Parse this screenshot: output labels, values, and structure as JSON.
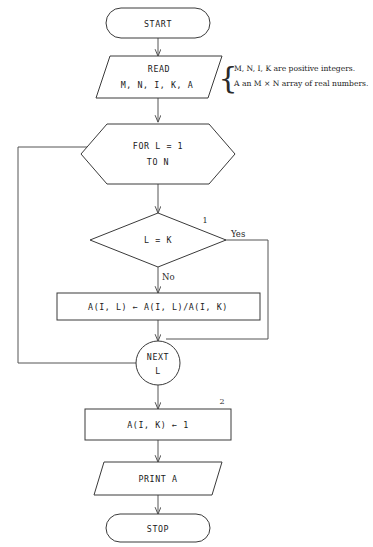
{
  "diagram": {
    "nodes": {
      "start": {
        "label": "START",
        "shape": "terminator"
      },
      "read": {
        "line1": "READ",
        "line2": "M, N, I, K, A",
        "shape": "parallelogram"
      },
      "for_loop": {
        "line1": "FOR L = 1",
        "line2": "TO N",
        "shape": "hexagon"
      },
      "decision": {
        "label": "L = K",
        "shape": "diamond"
      },
      "assign_divide": {
        "label": "A(I, L) ← A(I, L)/A(I, K)",
        "shape": "process"
      },
      "next": {
        "line1": "NEXT",
        "line2": "L",
        "shape": "circle"
      },
      "assign_one": {
        "label": "A(I, K) ← 1",
        "shape": "process"
      },
      "print": {
        "label": "PRINT A",
        "shape": "parallelogram"
      },
      "stop": {
        "label": "STOP",
        "shape": "terminator"
      }
    },
    "edge_labels": {
      "yes": "Yes",
      "no": "No"
    },
    "markers": {
      "one": "1",
      "two": "2"
    },
    "note": {
      "brace": "{",
      "line1": "M, N, I, K are positive integers.",
      "line2": "A an M × N array of real numbers."
    },
    "colors": {
      "shape_stroke": "#3a3a3a",
      "connector_stroke": "#555555",
      "text": "#1a1a1a",
      "background": "#ffffff"
    }
  }
}
